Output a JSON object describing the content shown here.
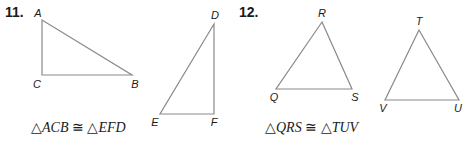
{
  "problems": [
    {
      "number": "11.",
      "triangle1": {
        "vertices": {
          "A": {
            "label": "A",
            "x": 42,
            "y": 20
          },
          "C": {
            "label": "C",
            "x": 42,
            "y": 75
          },
          "B": {
            "label": "B",
            "x": 132,
            "y": 75
          }
        }
      },
      "triangle2": {
        "vertices": {
          "D": {
            "label": "D",
            "x": 214,
            "y": 24
          },
          "E": {
            "label": "E",
            "x": 160,
            "y": 114
          },
          "F": {
            "label": "F",
            "x": 214,
            "y": 114
          }
        }
      },
      "statement": {
        "left_symbol": "△",
        "left_name": "ACB",
        "congruent": "≅",
        "right_symbol": "△",
        "right_name": "EFD",
        "full": "△ACB ≅ △EFD"
      }
    },
    {
      "number": "12.",
      "triangle1": {
        "vertices": {
          "R": {
            "label": "R",
            "x": 322,
            "y": 22
          },
          "Q": {
            "label": "Q",
            "x": 276,
            "y": 89
          },
          "S": {
            "label": "S",
            "x": 352,
            "y": 89
          }
        }
      },
      "triangle2": {
        "vertices": {
          "T": {
            "label": "T",
            "x": 419,
            "y": 30
          },
          "V": {
            "label": "V",
            "x": 385,
            "y": 100
          },
          "U": {
            "label": "U",
            "x": 459,
            "y": 100
          }
        }
      },
      "statement": {
        "left_symbol": "△",
        "left_name": "QRS",
        "congruent": "≅",
        "right_symbol": "△",
        "right_name": "TUV",
        "full": "△QRS ≅ △TUV"
      }
    }
  ],
  "colors": {
    "stroke": "#8a8a8a",
    "text": "#1a1a1a",
    "background": "#ffffff"
  }
}
